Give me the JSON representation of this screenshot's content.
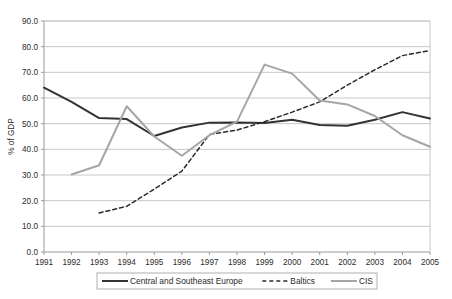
{
  "chart_data": {
    "type": "line",
    "title": "",
    "xlabel": "",
    "ylabel": "% of GDP",
    "xlim": [
      1991,
      2005
    ],
    "ylim": [
      0.0,
      90.0
    ],
    "ytick_step": 10.0,
    "grid": true,
    "legend_position": "bottom",
    "categories": [
      "1991",
      "1992",
      "1993",
      "1994",
      "1995",
      "1996",
      "1997",
      "1998",
      "1999",
      "2000",
      "2001",
      "2002",
      "2003",
      "2004",
      "2005"
    ],
    "ytick_labels": [
      "90.0",
      "80.0",
      "70.0",
      "60.0",
      "50.0",
      "40.0",
      "30.0",
      "20.0",
      "10.0",
      "0.0"
    ],
    "ytick_values": [
      90.0,
      80.0,
      70.0,
      60.0,
      50.0,
      40.0,
      30.0,
      20.0,
      10.0,
      0.0
    ],
    "series": [
      {
        "name": "Central and Southeast Europe",
        "style": "solid",
        "color": "#333333",
        "x": [
          1991,
          1992,
          1993,
          1994,
          1995,
          1996,
          1997,
          1998,
          1999,
          2000,
          2001,
          2002,
          2003,
          2004,
          2005
        ],
        "values": [
          64.0,
          58.5,
          52.2,
          51.8,
          45.2,
          48.5,
          50.4,
          50.5,
          50.3,
          51.5,
          49.5,
          49.2,
          51.5,
          54.5,
          52.0
        ]
      },
      {
        "name": "Baltics",
        "style": "dashed",
        "color": "#2b2b2b",
        "x": [
          1993,
          1994,
          1995,
          1996,
          1997,
          1998,
          1999,
          2000,
          2001,
          2002,
          2003,
          2004,
          2005
        ],
        "values": [
          15.2,
          17.8,
          24.5,
          31.5,
          45.8,
          47.5,
          50.8,
          54.5,
          58.5,
          65.0,
          71.0,
          76.5,
          78.5
        ]
      },
      {
        "name": "CIS",
        "style": "solid",
        "color": "#a6a6a6",
        "x": [
          1992,
          1993,
          1994,
          1995,
          1996,
          1997,
          1998,
          1999,
          2000,
          2001,
          2002,
          2003,
          2004,
          2005
        ],
        "values": [
          30.2,
          33.8,
          56.8,
          45.0,
          37.5,
          45.5,
          50.8,
          73.0,
          69.5,
          59.0,
          57.5,
          53.0,
          45.5,
          41.0
        ]
      }
    ]
  },
  "legend": {
    "items": [
      {
        "label": "Central and Southeast Europe",
        "marker": "solid-dark"
      },
      {
        "label": "Baltics",
        "marker": "dashed-dark"
      },
      {
        "label": "CIS",
        "marker": "solid-gray"
      }
    ]
  },
  "colors": {
    "series_central": "#333333",
    "series_baltics": "#2b2b2b",
    "series_cis": "#a6a6a6",
    "gridline": "#c8c8c8",
    "axis": "#9a9a9a",
    "background": "#ffffff"
  }
}
